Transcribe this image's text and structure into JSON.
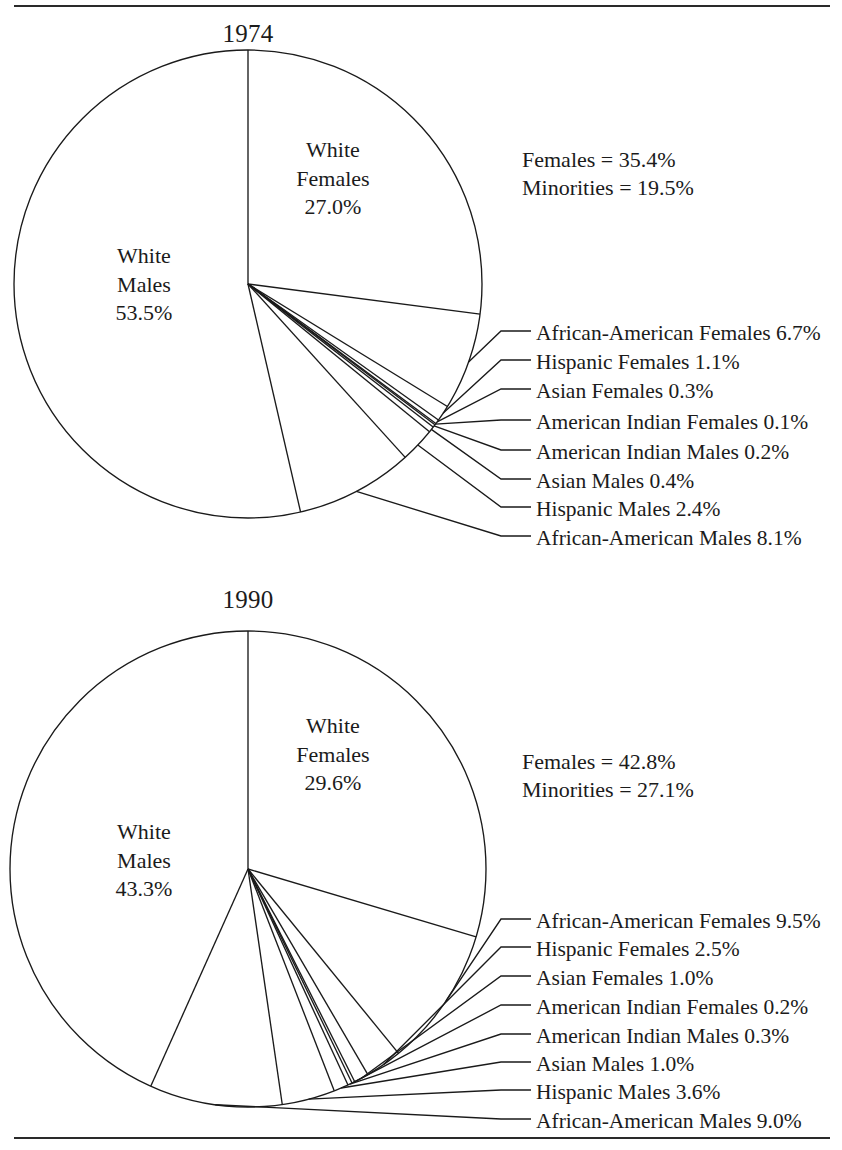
{
  "page": {
    "rules": [
      "top-rule",
      "bottom-rule"
    ],
    "ink_color": "#1a1a1a",
    "background": "#ffffff"
  },
  "charts": [
    {
      "id": "1974",
      "title": "1974",
      "summary": {
        "females_line": "Females = 35.4%",
        "minorities_line": "Minorities = 19.5%"
      },
      "inside_labels": [
        {
          "name": "white-females",
          "line1": "White",
          "line2": "Females",
          "line3": "27.0%"
        },
        {
          "name": "white-males",
          "line1": "White",
          "line2": "Males",
          "line3": "53.5%"
        }
      ],
      "leader_labels": [
        "African-American Females 6.7%",
        "Hispanic Females 1.1%",
        "Asian Females 0.3%",
        "American Indian Females 0.1%",
        "American Indian Males 0.2%",
        "Asian Males 0.4%",
        "Hispanic Males 2.4%",
        "African-American Males 8.1%"
      ]
    },
    {
      "id": "1990",
      "title": "1990",
      "summary": {
        "females_line": "Females = 42.8%",
        "minorities_line": "Minorities = 27.1%"
      },
      "inside_labels": [
        {
          "name": "white-females",
          "line1": "White",
          "line2": "Females",
          "line3": "29.6%"
        },
        {
          "name": "white-males",
          "line1": "White",
          "line2": "Males",
          "line3": "43.3%"
        }
      ],
      "leader_labels": [
        "African-American Females 9.5%",
        "Hispanic Females 2.5%",
        "Asian Females 1.0%",
        "American Indian Females 0.2%",
        "American Indian Males 0.3%",
        "Asian Males 1.0%",
        "Hispanic Males 3.6%",
        "African-American Males 9.0%"
      ]
    }
  ],
  "chart_data": [
    {
      "type": "pie",
      "title": "1974",
      "categories": [
        "White Females",
        "African-American Females",
        "Hispanic Females",
        "Asian Females",
        "American Indian Females",
        "American Indian Males",
        "Asian Males",
        "Hispanic Males",
        "African-American Males",
        "White Males"
      ],
      "values": [
        27.0,
        6.7,
        1.1,
        0.3,
        0.1,
        0.2,
        0.4,
        2.4,
        8.1,
        53.5
      ],
      "value_labels": [
        "27.0%",
        "6.7%",
        "1.1%",
        "0.3%",
        "0.1%",
        "0.2%",
        "0.4%",
        "2.4%",
        "8.1%",
        "53.5%"
      ],
      "annotations": [
        "Females = 35.4%",
        "Minorities = 19.5%"
      ],
      "start_angle_deg": -90,
      "direction": "clockwise",
      "legend": "leader-lines-right",
      "grid": false
    },
    {
      "type": "pie",
      "title": "1990",
      "categories": [
        "White Females",
        "African-American Females",
        "Hispanic Females",
        "Asian Females",
        "American Indian Females",
        "American Indian Males",
        "Asian Males",
        "Hispanic Males",
        "African-American Males",
        "White Males"
      ],
      "values": [
        29.6,
        9.5,
        2.5,
        1.0,
        0.2,
        0.3,
        1.0,
        3.6,
        9.0,
        43.3
      ],
      "value_labels": [
        "29.6%",
        "9.5%",
        "2.5%",
        "1.0%",
        "0.2%",
        "0.3%",
        "1.0%",
        "3.6%",
        "9.0%",
        "43.3%"
      ],
      "annotations": [
        "Females = 42.8%",
        "Minorities = 27.1%"
      ],
      "start_angle_deg": -90,
      "direction": "clockwise",
      "legend": "leader-lines-right",
      "grid": false
    }
  ]
}
